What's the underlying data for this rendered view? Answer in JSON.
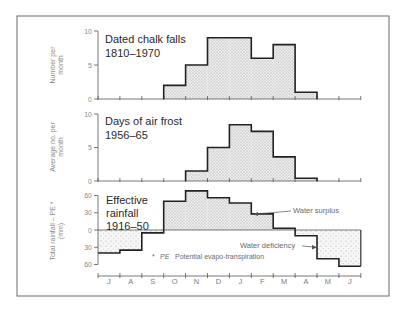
{
  "colors": {
    "ink": "#2a2a2a",
    "light_ink": "#8a8a8a",
    "frame": "#6a6a6a",
    "fill": "#e4e4e4",
    "background": "#ffffff"
  },
  "months": [
    "J",
    "A",
    "S",
    "O",
    "N",
    "D",
    "J",
    "F",
    "M",
    "A",
    "M",
    "J"
  ],
  "chart_data": [
    {
      "type": "bar",
      "title": "Dated chalk falls 1810–1970",
      "title_lines": [
        "Dated chalk falls",
        "1810–1970"
      ],
      "xlabel": "",
      "ylabel": "Number per month",
      "ylabel_lines": [
        "Number per",
        "month"
      ],
      "categories": [
        "J",
        "A",
        "S",
        "O",
        "N",
        "D",
        "J",
        "F",
        "M",
        "A",
        "M",
        "J"
      ],
      "values": [
        0,
        0,
        0,
        2,
        5,
        9,
        9,
        6,
        8,
        1,
        0,
        0
      ],
      "ylim": [
        0,
        10
      ],
      "yticks": [
        0,
        5,
        10
      ],
      "ytick_labels": [
        "0",
        "5",
        "10"
      ],
      "grid": false,
      "style": "step-histogram"
    },
    {
      "type": "bar",
      "title": "Days of air frost 1956–65",
      "title_lines": [
        "Days of air frost",
        "1956–65"
      ],
      "xlabel": "",
      "ylabel": "Average no. per month",
      "ylabel_lines": [
        "Average no. per",
        "month"
      ],
      "categories": [
        "J",
        "A",
        "S",
        "O",
        "N",
        "D",
        "J",
        "F",
        "M",
        "A",
        "M",
        "J"
      ],
      "values": [
        0,
        0,
        0,
        0,
        1.5,
        5,
        8.4,
        7.4,
        3.6,
        0.4,
        0,
        0
      ],
      "ylim": [
        0,
        10
      ],
      "yticks": [
        0,
        5,
        10
      ],
      "ytick_labels": [
        "0",
        "5",
        "10"
      ],
      "grid": false,
      "style": "step-histogram"
    },
    {
      "type": "bar",
      "title": "Effective rainfall 1916–50",
      "title_lines": [
        "Effective",
        "rainfall",
        "1916–50"
      ],
      "xlabel": "",
      "ylabel": "Total rainfall – PE * (mm)",
      "ylabel_lines": [
        "Total rainfall – PE *",
        "(mm)"
      ],
      "categories": [
        "J",
        "A",
        "S",
        "O",
        "N",
        "D",
        "J",
        "F",
        "M",
        "A",
        "M",
        "J"
      ],
      "values": [
        -40,
        -35,
        -5,
        50,
        68,
        56,
        47,
        28,
        3,
        -10,
        -50,
        -63
      ],
      "ylim": [
        -70,
        70
      ],
      "yticks": [
        60,
        30,
        0,
        -30,
        -60
      ],
      "ytick_labels": [
        "60",
        "30",
        "0",
        "30",
        "60"
      ],
      "grid": false,
      "style": "step-histogram",
      "annotations": [
        {
          "text": "Water surplus",
          "points_to": "F"
        },
        {
          "text": "Water deficiency",
          "points_to": "M (May)"
        }
      ],
      "footnote": "* PE  Potential evapo-transpiration"
    }
  ],
  "labels": {
    "c1_title_1": "Dated chalk falls",
    "c1_title_2": "1810–1970",
    "c1_ylabel_1": "Number per",
    "c1_ylabel_2": "month",
    "c2_title_1": "Days of air frost",
    "c2_title_2": "1956–65",
    "c2_ylabel_1": "Average no. per",
    "c2_ylabel_2": "month",
    "c3_title_1": "Effective",
    "c3_title_2": "rainfall",
    "c3_title_3": "1916–50",
    "c3_ylabel_1": "Total rainfall – PE *",
    "c3_ylabel_2": "(mm)",
    "surplus": "Water surplus",
    "deficiency": "Water deficiency",
    "footnote_star": "*",
    "footnote_pe": "PE",
    "footnote_text": "Potential evapo-transpiration"
  }
}
